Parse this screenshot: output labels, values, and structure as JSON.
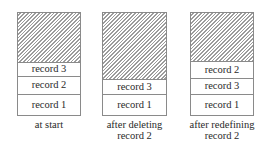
{
  "diagram": {
    "columns": [
      {
        "id": "at-start",
        "caption_lines": [
          "at start"
        ],
        "free_height": 50,
        "records": [
          {
            "label": "record 3",
            "height": 14
          },
          {
            "label": "record 2",
            "height": 18
          },
          {
            "label": "record 1",
            "height": 20
          }
        ]
      },
      {
        "id": "after-deleting",
        "caption_lines": [
          "after deleting",
          "record 2"
        ],
        "free_height": 67,
        "records": [
          {
            "label": "record 3",
            "height": 15
          },
          {
            "label": "record 1",
            "height": 20
          }
        ]
      },
      {
        "id": "after-redefining",
        "caption_lines": [
          "after redefining",
          "record 2"
        ],
        "free_height": 49,
        "records": [
          {
            "label": "record 2",
            "height": 17
          },
          {
            "label": "record 3",
            "height": 16
          },
          {
            "label": "record 1",
            "height": 20
          }
        ]
      }
    ],
    "legend": {
      "hatched": "free space"
    },
    "colors": {
      "border": "#8a8a8a",
      "hatch": "#9c9c9c",
      "text": "#2a2a2a"
    }
  }
}
